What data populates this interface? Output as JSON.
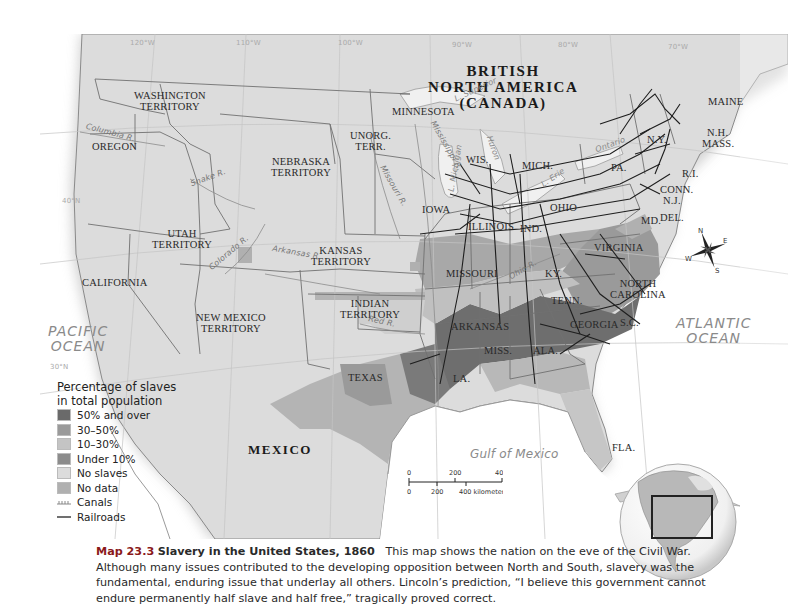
{
  "map": {
    "title": "Slavery in the United States, 1860",
    "countries": {
      "canada": [
        "BRITISH",
        "NORTH AMERICA",
        "(CANADA)"
      ],
      "mexico": "MEXICO"
    },
    "oceans": {
      "pacific": [
        "PACIFIC",
        "OCEAN"
      ],
      "atlantic": [
        "ATLANTIC",
        "OCEAN"
      ],
      "gulf": "Gulf of Mexico"
    },
    "lakes": {
      "superior": "L. Superior",
      "michigan": "L. Michigan",
      "huron": "Huron",
      "erie": "L. Erie",
      "ontario": "Ontario"
    },
    "rivers": {
      "columbia": "Columbia R.",
      "snake": "Snake R.",
      "colorado": "Colorado R.",
      "arkansas": "Arkansas R.",
      "red": "Red R.",
      "missouri": "Missouri R.",
      "mississippi": "Mississippi R.",
      "ohio": "Ohio R."
    },
    "gridlines": {
      "lon_120": "120°W",
      "lon_110": "110°W",
      "lon_100": "100°W",
      "lon_90": "90°W",
      "lon_80": "80°W",
      "lon_70": "70°W",
      "lat_40": "40°N",
      "lat_30": "30°N",
      "lat_50": "50°N"
    },
    "states": {
      "washington": [
        "WASHINGTON",
        "TERRITORY"
      ],
      "oregon": "OREGON",
      "california": "CALIFORNIA",
      "utah": [
        "UTAH",
        "TERRITORY"
      ],
      "new_mexico": [
        "NEW MEXICO",
        "TERRITORY"
      ],
      "nebraska": [
        "NEBRASKA",
        "TERRITORY"
      ],
      "kansas": [
        "KANSAS",
        "TERRITORY"
      ],
      "unorg": [
        "UNORG.",
        "TERR."
      ],
      "indian": [
        "INDIAN",
        "TERRITORY"
      ],
      "texas": "TEXAS",
      "minnesota": "MINNESOTA",
      "iowa": "IOWA",
      "missouri": "MISSOURI",
      "arkansas": "ARKANSAS",
      "la": "LA.",
      "wis": "WIS.",
      "mich": "MICH.",
      "illinois": "ILLINOIS",
      "ind": "IND.",
      "ohio": "OHIO",
      "ky": "KY.",
      "tenn": "TENN.",
      "miss": "MISS.",
      "ala": "ALA.",
      "georgia": "GEORGIA",
      "fla": "FLA.",
      "sc": "S.C.",
      "nc": [
        "NORTH",
        "CAROLINA"
      ],
      "virginia": "VIRGINIA",
      "md": "MD.",
      "del": "DEL.",
      "nj": "N.J.",
      "pa": "PA.",
      "ny": "N.Y.",
      "conn": "CONN.",
      "ri": "R.I.",
      "mass": "MASS.",
      "nh": "N.H.",
      "vt": "VT.",
      "maine": "MAINE"
    },
    "compass": {
      "n": "N",
      "s": "S",
      "e": "E",
      "w": "W"
    },
    "colors": {
      "land": "#dcdcdc",
      "water": "#ffffff",
      "lake": "#eeeeee",
      "boundary": "#6e6e6e",
      "railroad": "#1e1e1e"
    }
  },
  "legend": {
    "title": [
      "Percentage of slaves",
      "in total population"
    ],
    "items": [
      {
        "label": "50% and over",
        "color": "#6a6a6a"
      },
      {
        "label": "30–50%",
        "color": "#9a9a9a"
      },
      {
        "label": "10–30%",
        "color": "#c4c4c4"
      },
      {
        "label": "Under 10%",
        "color": "#8c8c8c"
      },
      {
        "label": "No slaves",
        "color": "#dcdcdc"
      },
      {
        "label": "No data",
        "color": "#b0b0b0"
      }
    ],
    "canals_label": "Canals",
    "railroads_label": "Railroads"
  },
  "scale": {
    "miles": [
      "0",
      "200",
      "400 miles"
    ],
    "km": [
      "0",
      "200",
      "400 kilometers"
    ]
  },
  "caption": {
    "number": "Map 23.3",
    "title": "Slavery in the United States, 1860",
    "text": "This map shows the nation on the eve of the Civil War. Although many issues contributed to the developing opposition between North and South, slavery was the fundamental, enduring issue that underlay all others. Lincoln’s prediction, “I believe this government cannot endure permanently half slave and half free,” tragically proved correct."
  }
}
